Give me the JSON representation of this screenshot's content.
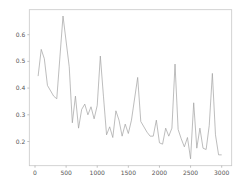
{
  "chart_data": {
    "type": "line",
    "title": "",
    "xlabel": "",
    "ylabel": "",
    "xlim": [
      -100,
      3150
    ],
    "ylim": [
      0.1,
      0.69
    ],
    "grid": false,
    "legend": null,
    "x_ticks": [
      0,
      500,
      1000,
      1500,
      2000,
      2500,
      3000
    ],
    "x_tick_labels": [
      "0",
      "500",
      "1000",
      "1500",
      "2000",
      "2500",
      "3000"
    ],
    "y_ticks": [
      0.2,
      0.3,
      0.4,
      0.5,
      0.6
    ],
    "y_tick_labels": [
      "0.2",
      "0.3",
      "0.4",
      "0.5",
      "0.6"
    ],
    "series": [
      {
        "name": "series-1",
        "color": "#a0a0a0",
        "x": [
          50,
          100,
          150,
          200,
          300,
          350,
          450,
          550,
          600,
          650,
          700,
          750,
          800,
          850,
          900,
          950,
          1000,
          1050,
          1100,
          1150,
          1200,
          1250,
          1300,
          1350,
          1400,
          1450,
          1500,
          1550,
          1650,
          1700,
          1800,
          1850,
          1900,
          1950,
          2000,
          2050,
          2100,
          2150,
          2200,
          2250,
          2300,
          2350,
          2400,
          2450,
          2500,
          2550,
          2600,
          2650,
          2700,
          2750,
          2800,
          2850,
          2900,
          2950,
          3000
        ],
        "values": [
          0.445,
          0.545,
          0.51,
          0.41,
          0.37,
          0.36,
          0.67,
          0.48,
          0.27,
          0.37,
          0.25,
          0.32,
          0.34,
          0.3,
          0.33,
          0.285,
          0.335,
          0.52,
          0.37,
          0.225,
          0.255,
          0.215,
          0.315,
          0.28,
          0.22,
          0.265,
          0.23,
          0.28,
          0.44,
          0.275,
          0.235,
          0.22,
          0.22,
          0.28,
          0.195,
          0.19,
          0.25,
          0.22,
          0.25,
          0.49,
          0.245,
          0.21,
          0.18,
          0.215,
          0.135,
          0.345,
          0.175,
          0.25,
          0.175,
          0.17,
          0.26,
          0.455,
          0.225,
          0.15,
          0.15
        ]
      }
    ]
  },
  "plot_area": {
    "left": 29.3,
    "top": 9.7,
    "right": 231.7,
    "bottom": 165.7,
    "x0_px": 35.0,
    "x_px_per_unit": 0.06223,
    "y06_px": 34.7,
    "y_px_per_unit": 267.0
  },
  "colors": {
    "line": "#a0a0a0",
    "frame": "#c8c8c8",
    "background": "#ffffff"
  }
}
